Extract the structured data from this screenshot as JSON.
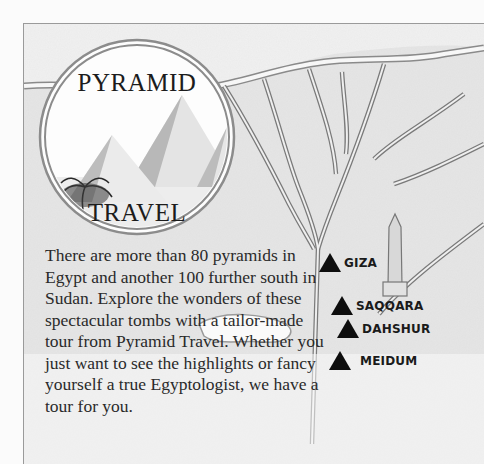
{
  "logo": {
    "top_word": "PYRAMID",
    "bottom_word": "TRAVEL"
  },
  "intro": {
    "text": "There are more than 80 pyramids in Egypt and another 100 further south in Sudan. Explore the wonders of these spectacular tombs with a tailor-made tour from Pyramid Travel. Whether you just want to see the highlights or fancy yourself a true Egyptologist, we have a tour for you."
  },
  "map": {
    "sites": [
      {
        "label": "GIZA"
      },
      {
        "label": "SAQQARA"
      },
      {
        "label": "DAHSHUR"
      },
      {
        "label": "MEIDUM"
      }
    ],
    "marker_color": "#0d0d0d"
  }
}
